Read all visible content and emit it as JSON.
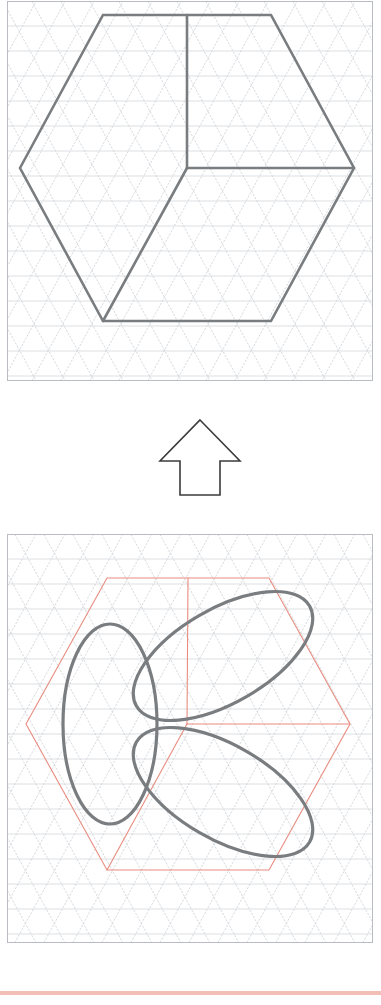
{
  "document": {
    "kind": "isometric-drawing-worksheet",
    "page_background": "#ffffff",
    "panel_border_color": "#b9bcc0",
    "grid_line_color": "#c9ccd1",
    "grid_horizontal_color": "#d4d7db",
    "figure_stroke_color": "#7a7d80",
    "construction_stroke_color": "#e98c7f",
    "arrow_stroke_color": "#3b3b3d",
    "footer_rule_color": "#f0b3a8"
  },
  "panels": [
    {
      "id": "top-panel",
      "label": "Isometric cube on triangular grid",
      "x": 7,
      "y": 1,
      "width": 366,
      "height": 380,
      "grid": {
        "type": "isometric-triangular",
        "cell_width": 29,
        "row_height": 25,
        "rows": 16,
        "columns": 14,
        "show_horizontals": true,
        "show_diagonals": true
      },
      "figure": {
        "name": "cube-outline",
        "type": "hexagon-with-center-y",
        "center": [
          180,
          167
        ],
        "radius_x": 167,
        "radius_y": 152,
        "stroke_width": 2.6,
        "vertices": [
          [
            13,
            167
          ],
          [
            96,
            14
          ],
          [
            264,
            14
          ],
          [
            347,
            167
          ],
          [
            264,
            320
          ],
          [
            96,
            320
          ]
        ],
        "interior_spokes": [
          [
            180,
            14
          ],
          [
            347,
            167
          ],
          [
            96,
            320
          ]
        ]
      },
      "ellipses": []
    },
    {
      "id": "bottom-panel",
      "label": "Isometric cube with three inscribed ellipses",
      "x": 7,
      "y": 534,
      "width": 366,
      "height": 409,
      "grid": {
        "type": "isometric-triangular",
        "cell_width": 29,
        "row_height": 25,
        "rows": 17,
        "columns": 14,
        "show_horizontals": true,
        "show_diagonals": true
      },
      "figure": {
        "name": "cube-outline-construction",
        "type": "hexagon-with-center-y",
        "center": [
          180,
          190
        ],
        "stroke_width": 1.1,
        "vertices": [
          [
            19,
            190
          ],
          [
            100,
            44
          ],
          [
            262,
            44
          ],
          [
            343,
            190
          ],
          [
            262,
            336
          ],
          [
            100,
            336
          ]
        ],
        "interior_spokes": [
          [
            181,
            44
          ],
          [
            343,
            190
          ],
          [
            100,
            336
          ]
        ]
      },
      "ellipses": [
        {
          "name": "ellipse-left-face",
          "face": "left",
          "center": [
            103,
            190
          ],
          "rx": 47,
          "ry": 100,
          "rotation_deg": 0,
          "stroke_width": 3.2
        },
        {
          "name": "ellipse-top-face",
          "face": "top",
          "center": [
            216,
            122
          ],
          "rx": 100,
          "ry": 47,
          "rotation_deg": -30,
          "stroke_width": 3.2
        },
        {
          "name": "ellipse-right-face",
          "face": "right",
          "center": [
            216,
            258
          ],
          "rx": 100,
          "ry": 47,
          "rotation_deg": 30,
          "stroke_width": 3.2
        }
      ]
    }
  ],
  "arrow": {
    "name": "up-arrow",
    "direction": "up",
    "x": 150,
    "y": 415,
    "width": 100,
    "height": 85,
    "stroke_width": 1.6,
    "stroke_color": "#3b3b3d",
    "fill": "#ffffff",
    "points": "50,5 90,46 70,46 70,80 30,80 30,46 10,46"
  },
  "footer": {
    "name": "footer-rule",
    "x": 0,
    "y": 990,
    "width": 381,
    "height": 4,
    "color": "#f0b3a8"
  },
  "chart_data": {
    "type": "diagram",
    "title": "",
    "annotations": []
  }
}
